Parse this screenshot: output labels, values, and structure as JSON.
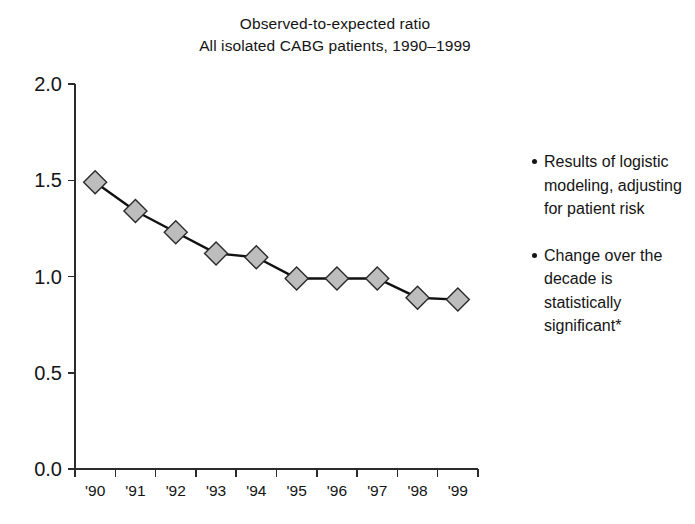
{
  "chart_data": {
    "type": "line",
    "title": "Observed-to-expected ratio",
    "subtitle": "All isolated CABG patients, 1990–1999",
    "xlabel": "",
    "ylabel": "",
    "categories": [
      "'90",
      "'91",
      "'92",
      "'93",
      "'94",
      "'95",
      "'96",
      "'97",
      "'98",
      "'99"
    ],
    "values": [
      1.49,
      1.34,
      1.23,
      1.12,
      1.1,
      0.99,
      0.99,
      0.99,
      0.89,
      0.88
    ],
    "series": [
      {
        "name": "Observed-to-expected ratio",
        "values": [
          1.49,
          1.34,
          1.23,
          1.12,
          1.1,
          0.99,
          0.99,
          0.99,
          0.89,
          0.88
        ]
      }
    ],
    "ylim": [
      0.0,
      2.0
    ],
    "yticks": [
      "0.0",
      "0.5",
      "1.0",
      "1.5",
      "2.0"
    ],
    "ytick_values": [
      0.0,
      0.5,
      1.0,
      1.5,
      2.0
    ],
    "grid": false,
    "legend": "none",
    "marker": "diamond",
    "marker_color": "#bdbdbd",
    "line_color": "#111111"
  },
  "title": {
    "line1": "Observed-to-expected ratio",
    "line2": "All isolated CABG patients, 1990–1999"
  },
  "notes": [
    {
      "text": "Results of logistic modeling, adjusting for patient risk"
    },
    {
      "text": "Change over the decade is statistically significant*"
    }
  ]
}
